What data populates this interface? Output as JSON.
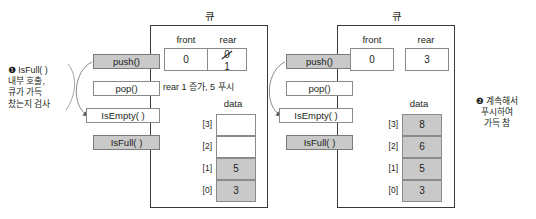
{
  "figure": {
    "kind": "queue-push-isfull-diagram",
    "colors": {
      "shaded_fill": "#c9c9c9",
      "border": "#8a8a8a",
      "panel_border": "#3a3a3a",
      "text": "#231f20"
    }
  },
  "panels": [
    {
      "id": "left",
      "title": "큐",
      "methods": [
        {
          "label": "push()",
          "shaded": true
        },
        {
          "label": "pop()",
          "shaded": false
        },
        {
          "label": "IsEmpty( )",
          "shaded": false
        },
        {
          "label": "IsFull( )",
          "shaded": true
        }
      ],
      "front": {
        "label": "front",
        "value": "0"
      },
      "rear": {
        "label": "rear",
        "old_value": "0",
        "value": "1",
        "struck": true
      },
      "note": "rear 1 증가, 5 푸시",
      "data": {
        "label": "data",
        "cells": [
          {
            "index": "[3]",
            "value": "",
            "filled": false
          },
          {
            "index": "[2]",
            "value": "",
            "filled": false
          },
          {
            "index": "[1]",
            "value": "5",
            "filled": true
          },
          {
            "index": "[0]",
            "value": "3",
            "filled": true
          }
        ]
      },
      "annotation": {
        "marker": "❶",
        "text": "IsFull( )\n내부 호출,\n큐가 가득\n찼는지 검사"
      }
    },
    {
      "id": "right",
      "title": "큐",
      "methods": [
        {
          "label": "push()",
          "shaded": true
        },
        {
          "label": "pop()",
          "shaded": false
        },
        {
          "label": "IsEmpty( )",
          "shaded": false
        },
        {
          "label": "IsFull( )",
          "shaded": true
        }
      ],
      "front": {
        "label": "front",
        "value": "0"
      },
      "rear": {
        "label": "rear",
        "old_value": "",
        "value": "3",
        "struck": false
      },
      "note": "",
      "data": {
        "label": "data",
        "cells": [
          {
            "index": "[3]",
            "value": "8",
            "filled": true
          },
          {
            "index": "[2]",
            "value": "6",
            "filled": true
          },
          {
            "index": "[1]",
            "value": "5",
            "filled": true
          },
          {
            "index": "[0]",
            "value": "3",
            "filled": true
          }
        ]
      },
      "annotation": {
        "marker": "❷",
        "text": "계속해서\n푸시하여\n가득 참"
      }
    }
  ]
}
